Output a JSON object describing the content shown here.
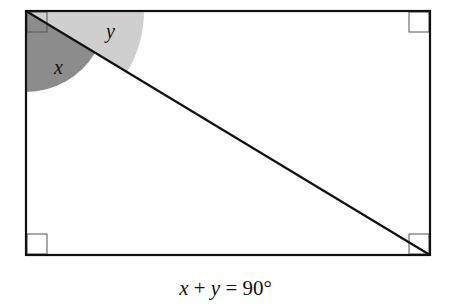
{
  "diagram": {
    "type": "rectangle-with-diagonal",
    "rectangle": {
      "x1": 26,
      "y1": 11,
      "x2": 430,
      "y2": 255
    },
    "diagonal": {
      "from": "top-left",
      "to": "bottom-right"
    },
    "right_angle_markers": [
      "top-left",
      "top-right",
      "bottom-left",
      "bottom-right"
    ],
    "angles": [
      {
        "label": "x",
        "between": "left side and diagonal",
        "shade": "#8c8c8c"
      },
      {
        "label": "y",
        "between": "top side and diagonal",
        "shade": "#cfcfcf"
      }
    ]
  },
  "labels": {
    "x": "x",
    "y": "y"
  },
  "caption": {
    "var1": "x",
    "op": " + ",
    "var2": "y",
    "rest": " = 90°"
  },
  "colors": {
    "line": "#111111",
    "marker": "#555555",
    "dark_wedge": "#8c8c8c",
    "light_wedge": "#cfcfcf"
  }
}
